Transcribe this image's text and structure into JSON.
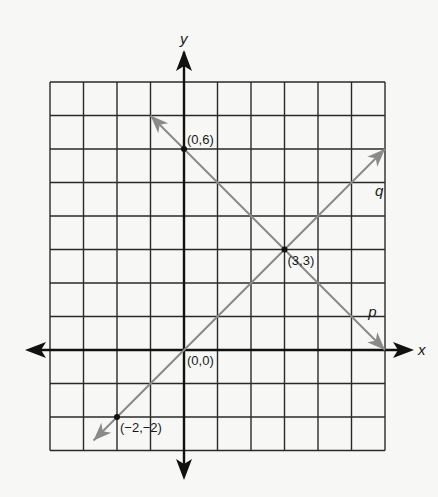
{
  "diagram": {
    "type": "coordinate-plane",
    "grid": {
      "x_min": -4,
      "x_max": 6,
      "y_min": -3,
      "y_max": 8,
      "step": 1
    },
    "axes": {
      "x_label": "x",
      "y_label": "y"
    },
    "lines": [
      {
        "name": "p",
        "label": "p",
        "passes_through": [
          [
            0,
            6
          ],
          [
            3,
            3
          ]
        ],
        "slope": -1,
        "intercept": 6,
        "drawn_from": [
          -1,
          7
        ],
        "drawn_to": [
          6,
          0
        ],
        "label_at": [
          5.5,
          1
        ],
        "color": "#8a8a8a"
      },
      {
        "name": "q",
        "label": "q",
        "passes_through": [
          [
            -2,
            -2
          ],
          [
            0,
            0
          ],
          [
            3,
            3
          ]
        ],
        "slope": 1,
        "intercept": 0,
        "drawn_from": [
          -2.7,
          -2.7
        ],
        "drawn_to": [
          6,
          6
        ],
        "label_at": [
          5.7,
          4.6
        ],
        "color": "#8a8a8a"
      }
    ],
    "points": [
      {
        "label": "(0,6)",
        "x": 0,
        "y": 6
      },
      {
        "label": "(3,3)",
        "x": 3,
        "y": 3
      },
      {
        "label": "(0,0)",
        "x": 0,
        "y": 0,
        "no_dot": true
      },
      {
        "label": "(−2,−2)",
        "x": -2,
        "y": -2
      }
    ],
    "colors": {
      "grid": "#2a2a2a",
      "axis": "#111111",
      "line": "#8a8a8a",
      "background": "#f7f7f5"
    }
  }
}
